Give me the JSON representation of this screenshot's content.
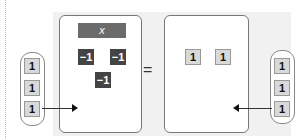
{
  "left_side": {
    "variable_label": "x",
    "negative_tiles": [
      "−1",
      "−1",
      "−1"
    ]
  },
  "equals": "=",
  "right_side": {
    "unit_tiles": [
      "1",
      "1"
    ]
  },
  "left_added_tiles": [
    "1",
    "1",
    "1"
  ],
  "right_added_tiles": [
    "1",
    "1",
    "1"
  ],
  "colors": {
    "variable_tile": "#6b6b6b",
    "negative_tile": "#444444",
    "unit_tile": "#d9d9d9",
    "panel_bg": "#f1f1f1"
  }
}
